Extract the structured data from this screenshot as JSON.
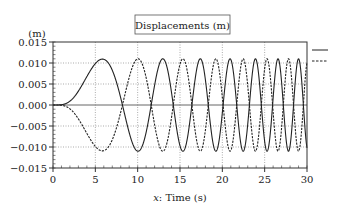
{
  "chart_data": {
    "type": "line",
    "title": "Displacements (m)",
    "xlabel": "x: Time (s)",
    "xlabel_italic_prefix": "x",
    "xlabel_rest": ": Time (s)",
    "ylabel": "(m)",
    "xlim": [
      0,
      30
    ],
    "ylim": [
      -0.015,
      0.015
    ],
    "xticks": [
      0,
      5,
      10,
      15,
      20,
      25,
      30
    ],
    "xtick_labels": [
      "0",
      "5",
      "10",
      "15",
      "20",
      "25",
      "30"
    ],
    "yticks": [
      0.015,
      0.01,
      0.005,
      0.0,
      -0.005,
      -0.01,
      -0.015
    ],
    "ytick_labels": [
      "0.015",
      "0.010",
      "0.005",
      "0.000",
      "−0.005",
      "−0.010",
      "−0.015"
    ],
    "grid": {
      "x": true,
      "y": true,
      "style": "dotted"
    },
    "legend": {
      "position": "right-top",
      "entries": [
        {
          "style": "solid",
          "label": ""
        },
        {
          "style": "dashed",
          "label": ""
        }
      ]
    },
    "model": {
      "description": "Chirp displacement: amplitude ramps to ~0.011 m by ~5 s, frequency increases with time; dashed series is the mirror (negative) of the solid series.",
      "peak_amplitude": 0.011,
      "first_peak_time": 5.8,
      "phase_coeff": 0.0467,
      "envelope_tau": 2.6
    },
    "series": [
      {
        "name": "solid",
        "style": "solid",
        "color": "#222222",
        "sign": 1
      },
      {
        "name": "dashed",
        "style": "dashed",
        "color": "#222222",
        "sign": -1
      }
    ],
    "approx_peaks_solid": [
      {
        "t": 5.8,
        "y": 0.011
      },
      {
        "t": 13.0,
        "y": 0.011
      },
      {
        "t": 17.6,
        "y": 0.011
      },
      {
        "t": 21.1,
        "y": 0.011
      },
      {
        "t": 24.1,
        "y": 0.011
      },
      {
        "t": 26.7,
        "y": 0.011
      },
      {
        "t": 29.1,
        "y": 0.011
      }
    ],
    "approx_troughs_solid": [
      {
        "t": 10.0,
        "y": -0.011
      },
      {
        "t": 15.5,
        "y": -0.011
      },
      {
        "t": 19.4,
        "y": -0.011
      },
      {
        "t": 22.6,
        "y": -0.011
      },
      {
        "t": 25.4,
        "y": -0.011
      },
      {
        "t": 27.9,
        "y": -0.011
      }
    ]
  },
  "plot": {
    "left": 53,
    "right": 307,
    "top": 42,
    "bottom": 168,
    "frame_color": "#333333",
    "grid_color": "#888888",
    "line_color": "#222222"
  }
}
